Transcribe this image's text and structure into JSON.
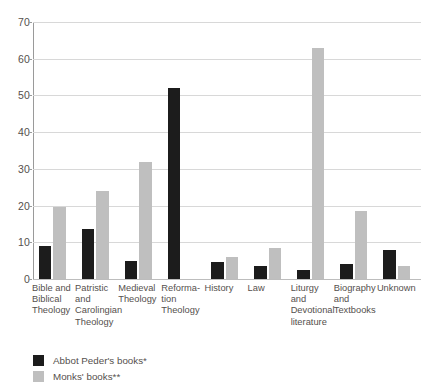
{
  "chart_data": {
    "type": "bar",
    "title": "",
    "subtitle": "",
    "xlabel": "",
    "ylabel": "",
    "ylim": [
      0,
      70
    ],
    "ytick_step": 10,
    "ytick_labels": [
      "0",
      "10",
      "20",
      "30",
      "40",
      "50",
      "60",
      "70"
    ],
    "grid": "horizontal",
    "legend_position": "bottom-left",
    "categories": [
      "Bible and Biblical Theology",
      "Patristic and Carolingian Theology",
      "Medieval Theology",
      "Reformation Theology",
      "History",
      "Law",
      "Liturgy and Devotional literature",
      "Biography and Textbooks",
      "Unknown"
    ],
    "category_label_lines": [
      [
        "Bible and",
        "Biblical",
        "Theology"
      ],
      [
        "Patristic",
        "and",
        "Carolingian",
        "Theology"
      ],
      [
        "Medieval",
        "Theology"
      ],
      [
        "Reforma-",
        "tion",
        "Theology"
      ],
      [
        "History"
      ],
      [
        "Law"
      ],
      [
        "Liturgy",
        "and",
        "Devotional",
        "literature"
      ],
      [
        "Biography",
        "and",
        "Textbooks"
      ],
      [
        "Unknown"
      ]
    ],
    "series": [
      {
        "name": "Abbot Peder's books*",
        "color": "#1c1c1c",
        "values": [
          9,
          13.5,
          5,
          52,
          4.5,
          3.5,
          2.5,
          4,
          8
        ]
      },
      {
        "name": "Monks' books**",
        "color": "#bfbfbf",
        "values": [
          19.5,
          24,
          32,
          null,
          6,
          8.5,
          63,
          18.5,
          3.5
        ]
      }
    ]
  },
  "legend": {
    "items": [
      {
        "label": "Abbot Peder's books*",
        "color": "#1c1c1c"
      },
      {
        "label": "Monks' books**",
        "color": "#bfbfbf"
      }
    ]
  },
  "axis": {
    "y_ticks": [
      "70",
      "60",
      "50",
      "40",
      "30",
      "20",
      "10",
      "0"
    ]
  },
  "colors": {
    "series_black": "#1c1c1c",
    "series_gray": "#bfbfbf",
    "gridline": "#d8d8d8",
    "axis": "#9a9a9a",
    "text": "#55504d",
    "background": "#ffffff"
  }
}
